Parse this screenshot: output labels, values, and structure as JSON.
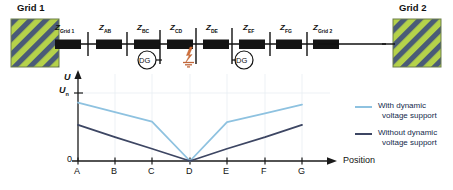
{
  "diagram": {
    "grids": [
      {
        "id": "grid-1",
        "label": "Grid 1"
      },
      {
        "id": "grid-2",
        "label": "Grid 2"
      }
    ],
    "impedances": [
      {
        "base": "Z",
        "sub": "Grid 1"
      },
      {
        "base": "Z",
        "sub": "AB"
      },
      {
        "base": "Z",
        "sub": "BC"
      },
      {
        "base": "Z",
        "sub": "CD"
      },
      {
        "base": "Z",
        "sub": "DE"
      },
      {
        "base": "Z",
        "sub": "EF"
      },
      {
        "base": "Z",
        "sub": "FG"
      },
      {
        "base": "Z",
        "sub": "Grid 2"
      }
    ],
    "distributed_generators": [
      {
        "label": "DG"
      },
      {
        "label": "DG"
      }
    ],
    "fault": {
      "name": "fault-symbol",
      "grounded": true
    },
    "colors": {
      "grid_hatch_light": "#b5d24a",
      "grid_hatch_dark": "#4a5b77",
      "impedance_block": "#141414",
      "fault": "#d4703a",
      "line": "#111111"
    }
  },
  "chart_data": {
    "type": "line",
    "title": "",
    "xlabel": "Position",
    "ylabel": "U",
    "categories": [
      "A",
      "B",
      "C",
      "D",
      "E",
      "F",
      "G"
    ],
    "ytick_labels": [
      "0",
      "Un"
    ],
    "ylim": [
      0,
      1.05
    ],
    "grid": true,
    "legend_position": "right",
    "series": [
      {
        "name": "With dynamic voltage support",
        "color": "#8ec2e0",
        "values": [
          0.86,
          0.72,
          0.58,
          0.0,
          0.57,
          0.7,
          0.83
        ]
      },
      {
        "name": "Without dynamic voltage support",
        "color": "#3d4663",
        "values": [
          0.53,
          0.35,
          0.18,
          0.0,
          0.18,
          0.35,
          0.53
        ]
      }
    ]
  },
  "legend": {
    "items": [
      {
        "line1": "With dynamic",
        "line2": "voltage support",
        "color": "#8ec2e0"
      },
      {
        "line1": "Without dynamic",
        "line2": "voltage support",
        "color": "#3d4663"
      }
    ]
  },
  "axis": {
    "y_name": "U",
    "y_nominal_base": "U",
    "y_nominal_sub": "n",
    "y_zero": "0",
    "x_name": "Position"
  }
}
